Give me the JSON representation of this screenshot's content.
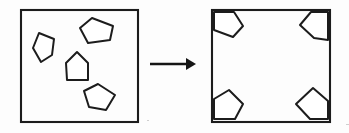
{
  "figure": {
    "caption": "",
    "background_color": "#fdfdfd",
    "ink_color": "#1c1c1c",
    "piece_fill_color": "#ffffff",
    "arrow_color": "#151515",
    "panels": [
      {
        "id": "before",
        "name": "scattered-pieces-panel",
        "label": "",
        "box": {
          "x": 21,
          "y": 10,
          "width": 117,
          "height": 112
        },
        "piece_count": 4,
        "pieces": [
          {
            "id": "piece-left-middle",
            "name": "pentagon-left-middle",
            "points": "39,33 54,39 52,55 41,62 33,48"
          },
          {
            "id": "piece-top-right",
            "name": "pentagon-top-right",
            "points": "92,18 113,26 110,40 88,43 80,28"
          },
          {
            "id": "piece-center-house",
            "name": "pentagon-center-house",
            "points": "77,52 88,63 88,80 67,80 66,63"
          },
          {
            "id": "piece-bottom",
            "name": "pentagon-bottom",
            "points": "98,84 115,95 106,110 89,107 84,91"
          }
        ]
      },
      {
        "id": "after",
        "name": "packed-corners-panel",
        "label": "",
        "box": {
          "x": 212,
          "y": 10,
          "width": 118,
          "height": 112
        },
        "piece_count": 4,
        "pieces": [
          {
            "id": "corner-top-left",
            "name": "pentagon-corner-top-left",
            "points": "214,12 234,12 243,26 233,37 214,30"
          },
          {
            "id": "corner-top-right",
            "name": "pentagon-corner-top-right",
            "points": "311,12 328,12 328,40 314,38 300,25"
          },
          {
            "id": "corner-bottom-left",
            "name": "pentagon-corner-bottom-left",
            "points": "229,90 243,104 235,119 214,119 214,99"
          },
          {
            "id": "corner-bottom-right",
            "name": "pentagon-corner-bottom-right",
            "points": "313,88 328,101 328,119 310,119 296,104"
          }
        ]
      }
    ],
    "arrow": {
      "name": "transformation-arrow",
      "direction": "right",
      "shaft": {
        "x1": 150,
        "y1": 64,
        "x2": 186,
        "y2": 64
      },
      "head": "186,58 196,64 186,70"
    },
    "specks": [
      {
        "x": 346,
        "y": 124,
        "w": 3,
        "h": 1
      },
      {
        "x": 147,
        "y": 120,
        "w": 2,
        "h": 1
      }
    ]
  }
}
